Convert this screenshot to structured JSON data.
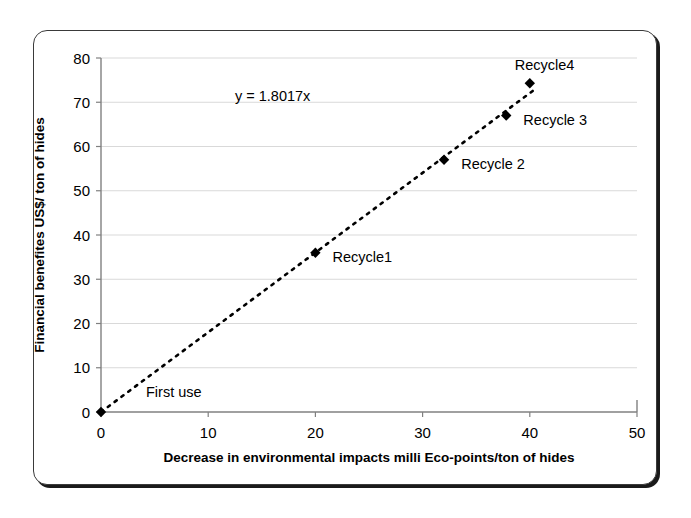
{
  "chart_data": {
    "type": "scatter",
    "title": "",
    "subtitle": "",
    "xlabel": "Decrease in environmental impacts milli Eco-points/ton of hides",
    "ylabel": "Financial benefites US$/ ton of hides",
    "xlim": [
      0,
      50
    ],
    "ylim": [
      0,
      80
    ],
    "xticks": [
      "0",
      "10",
      "20",
      "30",
      "40",
      "50"
    ],
    "xtick_values": [
      0,
      10,
      20,
      30,
      40,
      50
    ],
    "yticks": [
      "0",
      "10",
      "20",
      "30",
      "40",
      "50",
      "60",
      "70",
      "80"
    ],
    "ytick_values": [
      0,
      10,
      20,
      30,
      40,
      50,
      60,
      70,
      80
    ],
    "grid": "horizontal",
    "legend": "none",
    "marker_style": "diamond",
    "marker_color": "#000000",
    "trendline": {
      "style": "dotted",
      "color": "#000000",
      "equation": "y = 1.8017x",
      "slope": 1.8017,
      "intercept": 0,
      "x_start": 0,
      "x_end": 40.5
    },
    "points": [
      {
        "label": "First use",
        "x": 0,
        "y": 0
      },
      {
        "label": "Recycle1",
        "x": 20,
        "y": 36
      },
      {
        "label": "Recycle 2",
        "x": 32,
        "y": 57
      },
      {
        "label": "Recycle 3",
        "x": 37.8,
        "y": 67
      },
      {
        "label": "Recycle4",
        "x": 40,
        "y": 74.3
      }
    ],
    "annotations": [
      {
        "name": "equation",
        "text": "y = 1.8017x",
        "x": 12.5,
        "y": 71.5
      },
      {
        "name": "label-first-use",
        "text": "First use",
        "x": 4.2,
        "y": 4.6
      },
      {
        "name": "label-recycle1",
        "text": "Recycle1",
        "x": 21.6,
        "y": 35.0
      },
      {
        "name": "label-recycle2",
        "text": "Recycle 2",
        "x": 33.6,
        "y": 56.0
      },
      {
        "name": "label-recycle3",
        "text": "Recycle 3",
        "x": 39.4,
        "y": 66.0
      },
      {
        "name": "label-recycle4",
        "text": "Recycle4",
        "x": 38.6,
        "y": 78.5
      }
    ],
    "colors": {
      "gridline": "#d9d9d9",
      "axis": "#808080",
      "marker": "#000000",
      "text": "#000000",
      "frame": "#3a3a3a",
      "background": "#ffffff"
    }
  }
}
